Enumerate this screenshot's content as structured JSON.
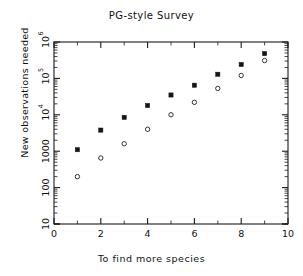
{
  "chart_data": {
    "type": "scatter",
    "title": "PG-style Survey",
    "xlabel": "To find more species",
    "ylabel": "New observations needed",
    "xlim": [
      0,
      10
    ],
    "ylim": [
      10,
      1000000
    ],
    "yscale": "log",
    "xscale": "linear",
    "grid": false,
    "legend": "none",
    "x_ticks": [
      "0",
      "2",
      "4",
      "6",
      "8",
      "10"
    ],
    "x_tick_values": [
      0,
      2,
      4,
      6,
      8,
      10
    ],
    "y_ticks": [
      "10",
      "100",
      "1000",
      "10^4",
      "10^5",
      "10^6"
    ],
    "y_tick_values": [
      10,
      100,
      1000,
      10000,
      100000,
      1000000
    ],
    "y_tick_labels": [
      {
        "mantissa": "10",
        "exponent": ""
      },
      {
        "mantissa": "100",
        "exponent": ""
      },
      {
        "mantissa": "1000",
        "exponent": ""
      },
      {
        "mantissa": "10",
        "exponent": "4"
      },
      {
        "mantissa": "10",
        "exponent": "5"
      },
      {
        "mantissa": "10",
        "exponent": "6"
      }
    ],
    "x": [
      1,
      2,
      3,
      4,
      5,
      6,
      7,
      8,
      9
    ],
    "series": [
      {
        "name": "filled",
        "marker": "filled-square",
        "color": "#151515",
        "values": [
          1100,
          3800,
          8500,
          18000,
          35000,
          65000,
          130000,
          240000,
          480000
        ]
      },
      {
        "name": "open",
        "marker": "open-circle",
        "color": "#333333",
        "values": [
          200,
          650,
          1600,
          4000,
          10000,
          22000,
          53000,
          120000,
          310000
        ]
      }
    ]
  },
  "figure": {
    "background": "#ffffff",
    "axis_color": "#1a1a1a"
  }
}
